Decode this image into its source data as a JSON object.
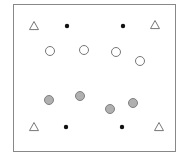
{
  "diagram": {
    "frame": {
      "x": 13,
      "y": 4,
      "width": 162,
      "height": 147,
      "stroke": "#888888"
    },
    "colors": {
      "outline": "#777777",
      "dot": "#111111",
      "gray_fill": "#b0b0b0",
      "gray_stroke": "#808080"
    },
    "triangles": [
      {
        "x": 34,
        "y": 26
      },
      {
        "x": 155,
        "y": 25
      },
      {
        "x": 34,
        "y": 127
      },
      {
        "x": 159,
        "y": 127
      }
    ],
    "dots": [
      {
        "x": 67,
        "y": 26
      },
      {
        "x": 123,
        "y": 26
      },
      {
        "x": 66,
        "y": 127
      },
      {
        "x": 122,
        "y": 127
      }
    ],
    "open_circles": [
      {
        "x": 50,
        "y": 51
      },
      {
        "x": 84,
        "y": 50
      },
      {
        "x": 116,
        "y": 52
      },
      {
        "x": 140,
        "y": 61
      }
    ],
    "gray_circles": [
      {
        "x": 49,
        "y": 100
      },
      {
        "x": 80,
        "y": 96
      },
      {
        "x": 110,
        "y": 109
      },
      {
        "x": 133,
        "y": 103
      }
    ]
  }
}
